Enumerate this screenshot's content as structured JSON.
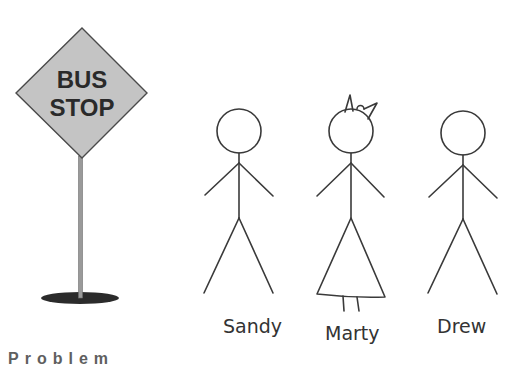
{
  "sign": {
    "line1": "BUS",
    "line2": "STOP",
    "fill_color": "#c4c4c4",
    "pole_color": "#9a9a9a",
    "base_color": "#2b2b2b"
  },
  "figures": [
    {
      "name": "Sandy",
      "type": "stick-figure"
    },
    {
      "name": "Marty",
      "type": "stick-figure-with-dress-and-bow"
    },
    {
      "name": "Drew",
      "type": "stick-figure"
    }
  ],
  "bottom_text_cut_off": "Problem"
}
